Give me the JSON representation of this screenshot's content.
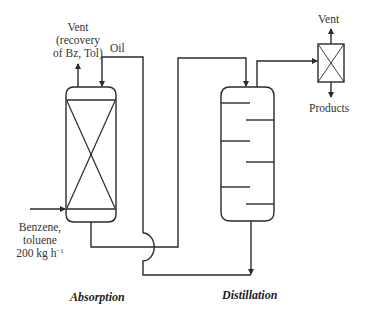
{
  "diagram": {
    "type": "process flow diagram",
    "units": [
      {
        "id": "absorber",
        "label": "Absorption",
        "kind": "packed column"
      },
      {
        "id": "distillation",
        "label": "Distillation",
        "kind": "tray column"
      },
      {
        "id": "condenser",
        "label": "",
        "kind": "separator box"
      }
    ],
    "streams": {
      "vent_absorber": {
        "line1": "Vent",
        "line2": "(recovery",
        "line3": "of Bz, Tol)"
      },
      "oil": {
        "label": "Oil"
      },
      "feed": {
        "line1": "Benzene,",
        "line2": "toluene",
        "line3_value": "200 kg h",
        "line3_exp": "−1"
      },
      "vent_top": {
        "label": "Vent"
      },
      "products": {
        "label": "Products"
      }
    },
    "captions": {
      "absorption": "Absorption",
      "distillation": "Distillation"
    },
    "colors": {
      "line": "#2a2a2a",
      "background": "#ffffff"
    }
  }
}
